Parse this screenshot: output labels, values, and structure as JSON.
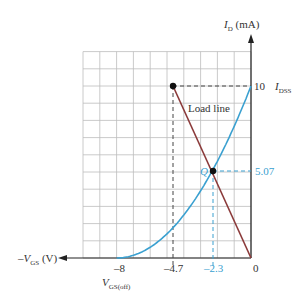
{
  "chart_data": {
    "type": "line",
    "title": "",
    "xlabel": "-V_GS (V)",
    "ylabel": "I_D (mA)",
    "xlim": [
      -10,
      0
    ],
    "ylim": [
      0,
      12
    ],
    "grid": true,
    "x_ticks": [
      {
        "value": -8,
        "label": "-8",
        "sublabel": "V_GS(off)"
      },
      {
        "value": -4.7,
        "label": "-4.7"
      },
      {
        "value": -2.3,
        "label": "-2.3",
        "color": "#3aa0d0"
      },
      {
        "value": 0,
        "label": "0"
      }
    ],
    "y_ticks": [
      {
        "value": 10,
        "label": "10",
        "sublabel": "I_DSS"
      },
      {
        "value": 5.07,
        "label": "5.07",
        "color": "#3aa0d0"
      }
    ],
    "series": [
      {
        "name": "Transfer characteristic",
        "color": "#3aa0d0",
        "equation": "I_D = 10(1 - V_GS/(-8))^2",
        "x": [
          -8,
          -7,
          -6,
          -5,
          -4,
          -3,
          -2.3,
          -2,
          -1,
          0
        ],
        "y": [
          0,
          0.16,
          0.63,
          1.41,
          2.5,
          3.91,
          5.07,
          5.63,
          7.66,
          10
        ]
      },
      {
        "name": "Load line",
        "color": "#8b3a3a",
        "x": [
          -4.7,
          0
        ],
        "y": [
          10,
          0
        ]
      }
    ],
    "annotations": [
      {
        "text": "Load line",
        "x": -3.3,
        "y": 8.2
      },
      {
        "text": "Q",
        "x": -2.3,
        "y": 5.07,
        "point": true
      },
      {
        "text": "",
        "x": -4.7,
        "y": 10,
        "point": true
      }
    ]
  },
  "labels": {
    "y_axis": "I",
    "y_axis_sub": "D",
    "y_axis_unit": " (mA)",
    "x_axis_prefix": "–V",
    "x_axis_sub": "GS",
    "x_axis_unit": " (V)",
    "idss_main": "I",
    "idss_sub": "DSS",
    "y10": "10",
    "y507": "5.07",
    "x0": "0",
    "x8": "–8",
    "x47": "–4.7",
    "x23": "–2.3",
    "vgsoff_main": "V",
    "vgsoff_sub": "GS(off)",
    "load_line": "Load line",
    "q": "Q"
  }
}
